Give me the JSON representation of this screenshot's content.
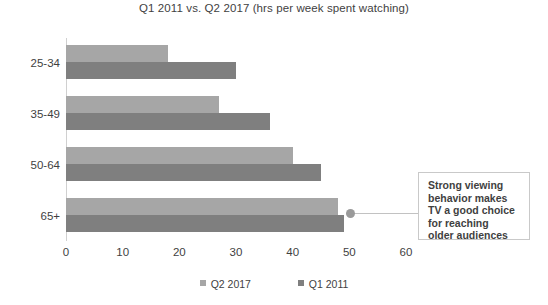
{
  "chart_data": {
    "type": "bar",
    "orientation": "horizontal",
    "title": "Q1 2011 vs. Q2 2017 (hrs per week spent watching)",
    "xlabel": "",
    "ylabel": "",
    "categories": [
      "25-34",
      "35-49",
      "50-64",
      "65+"
    ],
    "series": [
      {
        "name": "Q2 2017",
        "color": "#a6a6a6",
        "values": [
          18,
          27,
          40,
          48
        ]
      },
      {
        "name": "Q1 2011",
        "color": "#7f7f7f",
        "values": [
          30,
          36,
          45,
          49
        ]
      }
    ],
    "xlim": [
      0,
      60
    ],
    "xticks": [
      0,
      10,
      20,
      30,
      40,
      50,
      60
    ],
    "xtick_labels": [
      "0",
      "10",
      "20",
      "30",
      "40",
      "50",
      "60"
    ],
    "grid": false,
    "legend_position": "bottom",
    "legend_entries": [
      "Q2 2017",
      "Q1 2011"
    ],
    "annotations": [
      {
        "text": "Strong viewing behavior makes TV a good choice for reaching older audiences",
        "lines": [
          "Strong viewing",
          "behavior makes",
          "TV a good choice",
          "for reaching",
          "older audiences"
        ],
        "target_category": "65+",
        "target_value": 50
      }
    ]
  }
}
